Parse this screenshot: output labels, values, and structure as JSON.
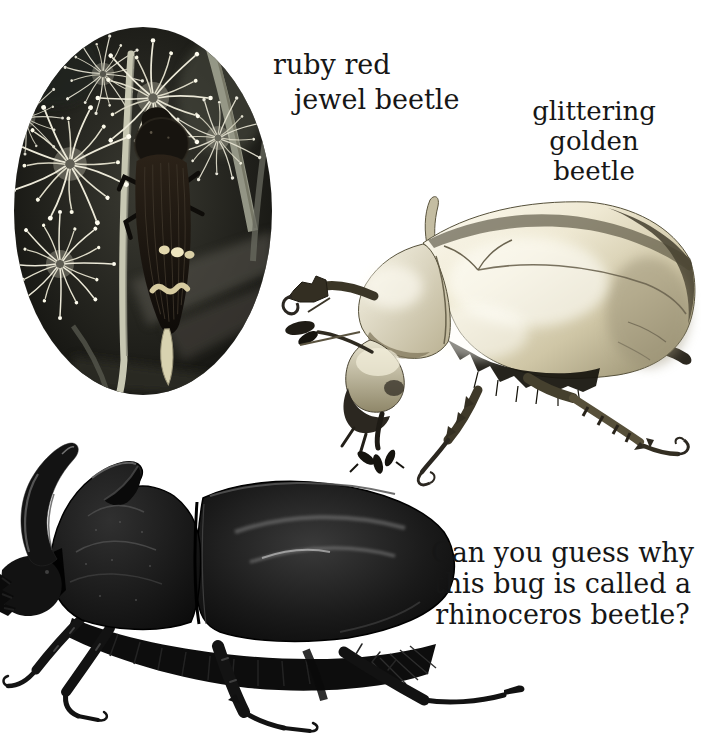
{
  "page": {
    "width": 701,
    "height": 744,
    "background": "#ffffff",
    "ink": "#161616"
  },
  "labels": {
    "jewel": {
      "line1": "ruby red",
      "line2": "jewel beetle"
    },
    "golden": {
      "line1": "glittering",
      "line2": "golden",
      "line3": "beetle"
    },
    "question": {
      "line1": "Can you guess why",
      "line2": "this bug is called a",
      "line3": "rhinoceros beetle?"
    }
  },
  "figures": {
    "jewel_photo": {
      "alt": "ruby red jewel beetle clinging to a stem among white blossoms, oval photo"
    },
    "golden_photo": {
      "alt": "glittering golden beetle, shiny metallic scarab"
    },
    "rhino_photo": {
      "alt": "black rhinoceros beetle with a curved horn"
    }
  },
  "colors": {
    "metallic_highlight": "#fdfbf2",
    "metallic_shadow": "#8f8768",
    "beetle_black": "#0d0d0d",
    "cream_spots": "#e9dfb8",
    "photo_background": "#20201b"
  }
}
